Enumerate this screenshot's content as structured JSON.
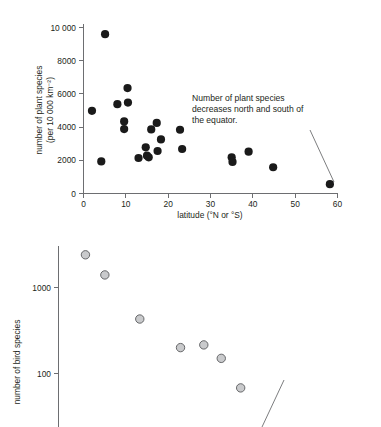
{
  "figure": {
    "background": "#ffffff",
    "ink_color": "#231f20",
    "axis_color": "#6d6e71"
  },
  "panels": {
    "top": {
      "annotation": "Number of plant species decreases north and south of the equator."
    },
    "bottom": {
      "annotation": "As in many other groups of organisms, bird species richness decreases with latitude away from the equator."
    }
  },
  "chart_data": [
    {
      "id": "plant-species-vs-latitude",
      "type": "scatter",
      "title": "",
      "xlabel": "latitude (°N or °S)",
      "ylabel": "number of plant species (per 10 000 km⁻²)",
      "ylabel_line1": "number of plant species",
      "ylabel_line2": "(per 10 000 km⁻²)",
      "xlim": [
        0,
        60
      ],
      "ylim": [
        0,
        10000
      ],
      "xticks": [
        0,
        10,
        20,
        30,
        40,
        50,
        60
      ],
      "xticklabels": [
        "0",
        "10",
        "20",
        "30",
        "40",
        "50",
        "60"
      ],
      "yticks": [
        0,
        2000,
        4000,
        6000,
        8000,
        10000
      ],
      "yticklabels": [
        "0",
        "2000",
        "4000",
        "6000",
        "8000",
        "10 000"
      ],
      "grid": false,
      "legend": "none",
      "marker": "filled-circle",
      "marker_color": "#1a1a1a",
      "points": [
        {
          "x": 2.0,
          "y": 4980
        },
        {
          "x": 4.2,
          "y": 1930
        },
        {
          "x": 5.1,
          "y": 9600
        },
        {
          "x": 8.0,
          "y": 5380
        },
        {
          "x": 9.6,
          "y": 4340
        },
        {
          "x": 9.6,
          "y": 3880
        },
        {
          "x": 10.4,
          "y": 6350
        },
        {
          "x": 10.5,
          "y": 5480
        },
        {
          "x": 13.0,
          "y": 2140
        },
        {
          "x": 14.7,
          "y": 2780
        },
        {
          "x": 15.0,
          "y": 2280
        },
        {
          "x": 15.4,
          "y": 2180
        },
        {
          "x": 16.0,
          "y": 3860
        },
        {
          "x": 17.3,
          "y": 4250
        },
        {
          "x": 17.5,
          "y": 2560
        },
        {
          "x": 18.3,
          "y": 3260
        },
        {
          "x": 22.8,
          "y": 3840
        },
        {
          "x": 23.3,
          "y": 2680
        },
        {
          "x": 35.0,
          "y": 2180
        },
        {
          "x": 35.2,
          "y": 1900
        },
        {
          "x": 39.0,
          "y": 2520
        },
        {
          "x": 44.8,
          "y": 1580
        },
        {
          "x": 58.2,
          "y": 560
        }
      ]
    },
    {
      "id": "bird-species-vs-latitude",
      "type": "scatter",
      "title": "",
      "xlabel": "",
      "ylabel": "number of bird species",
      "yscale": "log",
      "ylim": [
        30,
        3600
      ],
      "yticks": [
        100,
        1000
      ],
      "yticklabels": [
        "100",
        "1000"
      ],
      "grid": false,
      "legend": "none",
      "marker": "open-circle",
      "marker_fill": "#c9cacc",
      "marker_stroke": "#58595b",
      "points": [
        {
          "x": 0.09,
          "y": 2400
        },
        {
          "x": 0.19,
          "y": 1400
        },
        {
          "x": 0.37,
          "y": 430
        },
        {
          "x": 0.58,
          "y": 200
        },
        {
          "x": 0.7,
          "y": 215
        },
        {
          "x": 0.79,
          "y": 150
        },
        {
          "x": 0.89,
          "y": 68
        }
      ],
      "note": "x axis cropped off below the visible screenshot area"
    }
  ]
}
